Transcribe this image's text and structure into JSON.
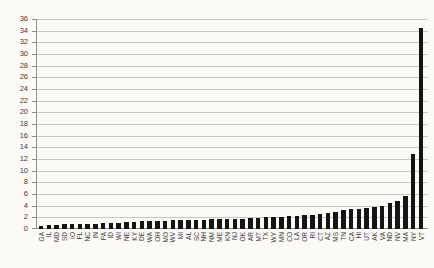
{
  "chart_data": {
    "type": "bar",
    "title": "",
    "xlabel": "",
    "ylabel": "",
    "ylim": [
      0,
      36
    ],
    "ytick_step": 2,
    "grid": true,
    "legend": false,
    "bar_color": "#141414",
    "gridline_color": "#c9c7c2",
    "axis_color": "#8f8d88",
    "text_color": "#3b3b3b",
    "background": "#fbfaf7",
    "categories": [
      "GA",
      "IL",
      "MD",
      "SD",
      "IO",
      "FL",
      "NC",
      "IN",
      "PA",
      "ID",
      "WI",
      "NE",
      "KY",
      "DE",
      "WA",
      "OH",
      "MO",
      "WV",
      "MI",
      "AL",
      "SC",
      "NH",
      "NM",
      "ME",
      "KN",
      "NJ",
      "OK",
      "AR",
      "MT",
      "TX",
      "WY",
      "MN",
      "CO",
      "LA",
      "OR",
      "RI",
      "CT",
      "AZ",
      "MS",
      "TN",
      "CA",
      "HI",
      "UT",
      "AK",
      "VA",
      "ND",
      "NV",
      "MA",
      "NY",
      "VT"
    ],
    "values": [
      0.5,
      0.7,
      0.75,
      0.8,
      0.8,
      0.85,
      0.9,
      0.9,
      1.0,
      1.0,
      1.1,
      1.15,
      1.2,
      1.3,
      1.4,
      1.4,
      1.45,
      1.5,
      1.5,
      1.55,
      1.6,
      1.6,
      1.65,
      1.7,
      1.7,
      1.8,
      1.8,
      1.9,
      1.95,
      2.0,
      2.0,
      2.1,
      2.2,
      2.3,
      2.4,
      2.4,
      2.5,
      2.8,
      3.0,
      3.2,
      3.4,
      3.5,
      3.6,
      3.8,
      4.0,
      4.4,
      4.8,
      5.6,
      12.9,
      34.4
    ]
  }
}
